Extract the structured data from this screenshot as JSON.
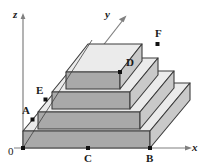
{
  "figure": {
    "background_color": "#ffffff",
    "width": 207,
    "height": 167
  },
  "axes": {
    "origin_label": "0",
    "items": [
      {
        "name": "z",
        "label": "z",
        "orientation": "vertical-up"
      },
      {
        "name": "y",
        "label": "y",
        "orientation": "diagonal-up-right"
      },
      {
        "name": "x",
        "label": "x",
        "orientation": "horizontal-right"
      }
    ]
  },
  "points": [
    {
      "id": "A",
      "label": "A",
      "on": "left-slope-edge-tier1"
    },
    {
      "id": "E",
      "label": "E",
      "on": "left-slope-edge-tier2"
    },
    {
      "id": "D",
      "label": "D",
      "on": "top-tier-front-right-corner"
    },
    {
      "id": "F",
      "label": "F",
      "on": "tier3-top-right-corner"
    },
    {
      "id": "C",
      "label": "C",
      "on": "x-axis"
    },
    {
      "id": "B",
      "label": "B",
      "on": "x-axis"
    }
  ],
  "solid": {
    "name": "stepped-pyramid",
    "tiers": 4,
    "colors": {
      "top_face": "#ebebeb",
      "front_face": "#a9a9a9",
      "side_face": "#c9c9c9",
      "outline": "#3c3c3c",
      "axis": "#7a7a7a",
      "point": "#111111"
    }
  }
}
